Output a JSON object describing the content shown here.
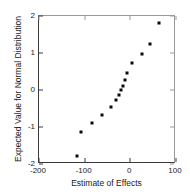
{
  "chart_data": {
    "type": "scatter",
    "title": "",
    "xlabel": "Estimate of Effects",
    "ylabel": "Expected Value for Normal Distribution",
    "xlim": [
      -200,
      100
    ],
    "ylim": [
      -2,
      2
    ],
    "xticks": [
      -200,
      -100,
      0,
      100
    ],
    "yticks": [
      -2,
      -1,
      0,
      1,
      2
    ],
    "xticklabels": [
      "-200",
      "-100",
      "0",
      "100"
    ],
    "yticklabels": [
      "-2",
      "-1",
      "0",
      "1",
      "2"
    ],
    "grid": false,
    "legend": false,
    "marker": "square",
    "marker_color": "#0a0a0a",
    "points": [
      {
        "x": -116,
        "y": -1.78
      },
      {
        "x": -107,
        "y": -1.14
      },
      {
        "x": -85,
        "y": -0.89
      },
      {
        "x": -61,
        "y": -0.68
      },
      {
        "x": -42,
        "y": -0.46
      },
      {
        "x": -31,
        "y": -0.27
      },
      {
        "x": -24,
        "y": -0.14
      },
      {
        "x": -20,
        "y": 0.0
      },
      {
        "x": -15,
        "y": 0.11
      },
      {
        "x": -11,
        "y": 0.27
      },
      {
        "x": -7,
        "y": 0.46
      },
      {
        "x": 4,
        "y": 0.73
      },
      {
        "x": 26,
        "y": 0.97
      },
      {
        "x": 42,
        "y": 1.24
      },
      {
        "x": 63,
        "y": 1.8
      }
    ]
  },
  "axis": {
    "x_title": "Estimate of Effects",
    "y_title": "Expected Value for Normal Distribution"
  }
}
